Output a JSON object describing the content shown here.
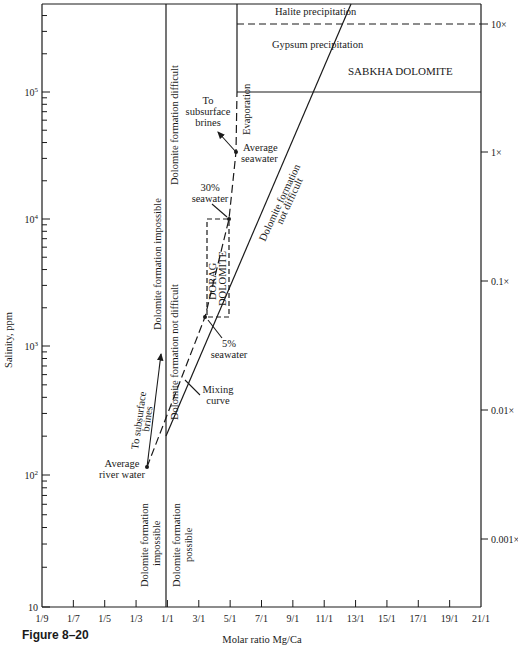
{
  "figure": {
    "caption": "Figure 8–20",
    "y_axis_label": "Salinity, ppm",
    "x_axis_label": "Molar ratio Mg/Ca"
  },
  "y_ticks": [
    {
      "label": "10",
      "sup": "",
      "y": 607
    },
    {
      "label": "10",
      "sup": "2",
      "y": 475
    },
    {
      "label": "10",
      "sup": "3",
      "y": 346
    },
    {
      "label": "10",
      "sup": "4",
      "y": 219
    },
    {
      "label": "10",
      "sup": "5",
      "y": 92
    }
  ],
  "x_ticks": [
    "1/9",
    "1/7",
    "1/5",
    "1/3",
    "1/1",
    "3/1",
    "5/1",
    "7/1",
    "9/1",
    "11/1",
    "13/1",
    "15/1",
    "17/1",
    "19/1",
    "21/1"
  ],
  "right_ticks": [
    {
      "label": "10×",
      "y": 24
    },
    {
      "label": "1×",
      "y": 152
    },
    {
      "label": "0.1×",
      "y": 281
    },
    {
      "label": "0.01×",
      "y": 410
    },
    {
      "label": "0.001×",
      "y": 539
    }
  ],
  "regions": {
    "halite": "Halite precipitation",
    "gypsum": "Gypsum precipitation",
    "sabkha": "SABKHA DOLOMITE",
    "dorag_1": "DORAG",
    "dorag_2": "DOLOMITE",
    "impossible_upper": "Dolomite formation impossible",
    "difficult": "Dolomite formation difficult",
    "not_difficult_mid": "Dolomite formation not difficult",
    "not_difficult_right_1": "Dolomite formation",
    "not_difficult_right_2": "not difficult",
    "evaporation": "Evaporation",
    "impossible_lower_1": "Dolomite formation",
    "impossible_lower_2": "impossible",
    "possible_lower_1": "Dolomite formation",
    "possible_lower_2": "possible"
  },
  "annotations": {
    "to_brines_upper": [
      "To",
      "subsurface",
      "brines"
    ],
    "to_brines_lower": [
      "To subsurface",
      "brines"
    ],
    "avg_seawater": [
      "Average",
      "seawater"
    ],
    "seawater_30": [
      "30%",
      "seawater"
    ],
    "seawater_5": [
      "5%",
      "seawater"
    ],
    "mixing_curve": [
      "Mixing",
      "curve"
    ],
    "avg_river": [
      "Average",
      "river water"
    ]
  },
  "points": {
    "river_water": {
      "x": 147,
      "y": 467
    },
    "seawater_5": {
      "x": 205,
      "y": 317
    },
    "seawater_30": {
      "x": 229,
      "y": 219
    },
    "avg_seawater": {
      "x": 236,
      "y": 152
    }
  },
  "colors": {
    "ink": "#1a1a1a",
    "background": "#ffffff"
  }
}
